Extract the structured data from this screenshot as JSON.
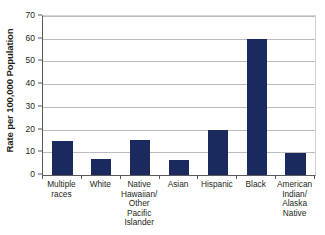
{
  "chart_data": {
    "type": "bar",
    "title": "",
    "xlabel": "",
    "ylabel": "Rate per 100,000 Population",
    "ylim": [
      0,
      70
    ],
    "ytick_step": 10,
    "yticks": [
      70,
      60,
      50,
      40,
      30,
      20,
      10,
      0
    ],
    "grid": true,
    "legend": "none",
    "bar_color": "#1b2a5e",
    "gridline_color": "#bcbcbc",
    "axis_color": "#58595b",
    "categories": [
      "Multiple\nraces",
      "White",
      "Native\nHawaiian/\nOther Pacific\nIslander",
      "Asian",
      "Hispanic",
      "Black",
      "American\nIndian/\nAlaska\nNative"
    ],
    "values": [
      15,
      7.2,
      15.5,
      6.7,
      19.8,
      60,
      9.5
    ]
  }
}
